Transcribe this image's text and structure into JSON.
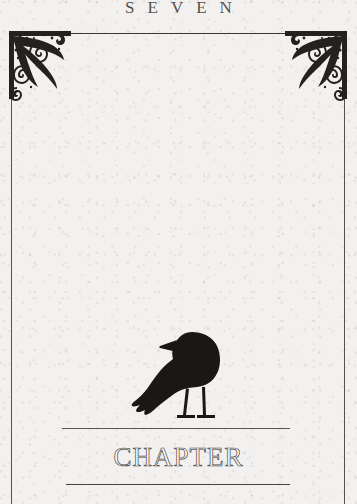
{
  "page": {
    "chapter_number_word": "SEVEN",
    "chapter_label": "CHAPTER",
    "paper_color": "#f2f1ef",
    "interior_color": "#fdfdfd",
    "ink_color": "#3c3a38",
    "rule_color": "#55524e"
  },
  "ornaments": {
    "corner_left_name": "acanthus-scroll-corner-ornament",
    "corner_right_name": "acanthus-scroll-corner-ornament-mirrored"
  },
  "illustration": {
    "subject": "raven",
    "description": "black raven silhouette in profile facing right, perched on a horizontal rule"
  }
}
